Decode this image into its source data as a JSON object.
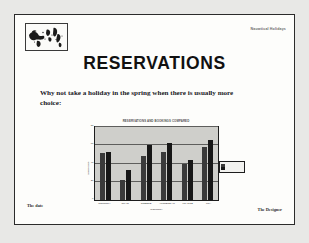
{
  "slide": {
    "company_name": "Nauwtical Holidays",
    "title": "RESERVATIONS",
    "body_text": "Why not take a holiday in the spring when there is usually more choice:",
    "footer_left": "The date",
    "footer_right": "The Designer",
    "logo_icon": "world-map-icon"
  },
  "chart_data": {
    "type": "bar",
    "title": "RESERVATIONS AND BOOKINGS COMPARED",
    "xlabel": "COUNTRY",
    "ylabel": "BOOKINGS",
    "categories": [
      "COUNTRY",
      "SPAIN",
      "GREECE",
      "AMSTERDAM",
      "FRANCE",
      "USA"
    ],
    "series": [
      {
        "name": "RESERVATIONS",
        "values": [
          52,
          22,
          48,
          53,
          40,
          58
        ]
      },
      {
        "name": "BOOKINGS",
        "values": [
          53,
          33,
          60,
          62,
          44,
          66
        ]
      }
    ],
    "ylim": [
      0,
      80
    ],
    "yticks": [
      0,
      20,
      40,
      60,
      80
    ],
    "grid": true,
    "legend_position": "right"
  }
}
